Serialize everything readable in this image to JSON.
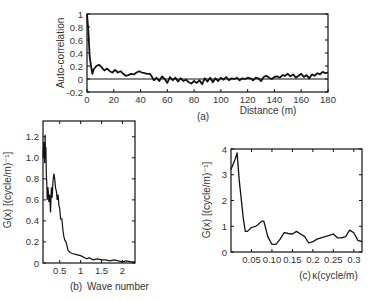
{
  "chart_data": [
    {
      "panel": "(a)",
      "type": "line",
      "title": "",
      "xlabel": "Distance (m)",
      "ylabel": "Auto-correlation",
      "xlim": [
        0,
        180
      ],
      "ylim": [
        -0.2,
        1
      ],
      "xticks": [
        0,
        20,
        40,
        60,
        80,
        100,
        120,
        140,
        160,
        180
      ],
      "yticks": [
        -0.2,
        0,
        0.2,
        0.4,
        0.6,
        0.8,
        1
      ],
      "ytick_labels": [
        "-0.2",
        "0",
        "0.2",
        "0.4",
        "0.6",
        "0.8",
        "1"
      ],
      "reference_line": 0,
      "grid": false,
      "x": [
        0,
        1,
        2,
        3,
        4,
        5,
        7,
        9,
        11,
        13,
        15,
        17,
        19,
        21,
        23,
        25,
        27,
        29,
        31,
        33,
        35,
        37,
        39,
        41,
        43,
        45,
        47,
        48,
        50,
        52,
        54,
        56,
        58,
        60,
        62,
        64,
        66,
        68,
        70,
        72,
        74,
        76,
        78,
        80,
        82,
        84,
        86,
        88,
        90,
        92,
        94,
        96,
        98,
        100,
        102,
        104,
        106,
        108,
        110,
        112,
        114,
        116,
        118,
        120,
        122,
        124,
        126,
        128,
        130,
        132,
        134,
        136,
        138,
        140,
        142,
        144,
        146,
        148,
        150,
        152,
        154,
        156,
        158,
        160,
        162,
        164,
        166,
        168,
        170,
        172,
        174,
        176,
        178,
        180
      ],
      "values": [
        1.0,
        0.75,
        0.35,
        0.2,
        0.08,
        0.15,
        0.2,
        0.22,
        0.18,
        0.13,
        0.16,
        0.12,
        0.1,
        0.14,
        0.1,
        0.12,
        0.08,
        0.05,
        0.06,
        0.08,
        0.07,
        0.1,
        0.12,
        0.1,
        0.09,
        0.08,
        0.08,
        0.05,
        -0.02,
        0.02,
        -0.03,
        0.04,
        0.0,
        -0.06,
        0.03,
        -0.02,
        0.02,
        -0.04,
        0.01,
        -0.03,
        -0.01,
        -0.05,
        -0.07,
        -0.03,
        -0.06,
        -0.02,
        -0.08,
        0.01,
        -0.04,
        0.02,
        -0.05,
        0.01,
        -0.03,
        0.02,
        -0.01,
        0.03,
        -0.02,
        0.01,
        0.0,
        0.02,
        -0.02,
        0.01,
        0.0,
        0.02,
        0.01,
        -0.02,
        0.02,
        0.01,
        -0.03,
        0.03,
        0.05,
        0.02,
        0.0,
        0.03,
        0.04,
        0.02,
        0.06,
        0.05,
        0.08,
        0.04,
        0.07,
        0.02,
        0.05,
        0.08,
        0.03,
        0.06,
        0.01,
        0.07,
        0.05,
        0.09,
        0.07,
        0.11,
        0.09,
        0.1
      ]
    },
    {
      "panel": "(b)",
      "type": "line",
      "title": "",
      "xlabel": "Wave number",
      "ylabel": "G(x) [(cycle/m)⁻¹]",
      "xlim": [
        0.1,
        2.3
      ],
      "ylim": [
        0,
        1.3
      ],
      "xticks": [
        0.5,
        1,
        1.5,
        2
      ],
      "xtick_labels": [
        "0.5",
        "1",
        "1.5",
        "2"
      ],
      "yticks": [
        0,
        0.2,
        0.4,
        0.6,
        0.8,
        1.0,
        1.2
      ],
      "ytick_labels": [
        "0",
        "0.2",
        "0.4",
        "0.6",
        "0.8",
        "1.0",
        "1.2"
      ],
      "grid": false,
      "x": [
        0.1,
        0.12,
        0.14,
        0.15,
        0.16,
        0.17,
        0.18,
        0.19,
        0.2,
        0.22,
        0.24,
        0.26,
        0.28,
        0.3,
        0.32,
        0.34,
        0.36,
        0.38,
        0.4,
        0.42,
        0.44,
        0.46,
        0.48,
        0.5,
        0.52,
        0.55,
        0.58,
        0.6,
        0.62,
        0.65,
        0.68,
        0.7,
        0.75,
        0.8,
        0.9,
        1.0,
        1.1,
        1.15,
        1.2,
        1.3,
        1.4,
        1.5,
        1.6,
        1.7,
        1.8,
        1.9,
        2.0,
        2.1,
        2.2,
        2.3
      ],
      "values": [
        1.0,
        1.15,
        0.95,
        1.22,
        1.05,
        1.1,
        0.85,
        0.75,
        0.6,
        0.72,
        0.58,
        0.65,
        0.48,
        0.72,
        0.62,
        0.78,
        0.85,
        0.8,
        0.72,
        0.68,
        0.6,
        0.65,
        0.55,
        0.52,
        0.42,
        0.42,
        0.3,
        0.25,
        0.22,
        0.2,
        0.15,
        0.12,
        0.1,
        0.09,
        0.08,
        0.07,
        0.05,
        0.04,
        0.05,
        0.03,
        0.04,
        0.03,
        0.03,
        0.02,
        0.03,
        0.02,
        0.01,
        0.02,
        0.01,
        0.01
      ]
    },
    {
      "panel": "(c)",
      "type": "line",
      "title": "",
      "xlabel": "κ(cycle/m)",
      "ylabel": "G(x) [(cycle/m)⁻¹]",
      "xlim": [
        0.0,
        0.32
      ],
      "ylim": [
        0,
        4
      ],
      "xticks": [
        0.05,
        0.1,
        0.15,
        0.2,
        0.25,
        0.3
      ],
      "xtick_labels": [
        "0.05",
        "0.10",
        "0.15",
        "0.2",
        "0.25",
        "0.3"
      ],
      "yticks": [
        0,
        1,
        2,
        3,
        4
      ],
      "ytick_labels": [
        "0",
        "1",
        "2",
        "3",
        "4"
      ],
      "grid": false,
      "x": [
        0.0,
        0.01,
        0.015,
        0.02,
        0.03,
        0.035,
        0.04,
        0.05,
        0.06,
        0.065,
        0.075,
        0.08,
        0.09,
        0.1,
        0.11,
        0.12,
        0.13,
        0.14,
        0.15,
        0.16,
        0.17,
        0.18,
        0.19,
        0.2,
        0.21,
        0.22,
        0.23,
        0.24,
        0.25,
        0.26,
        0.27,
        0.28,
        0.29,
        0.3,
        0.31,
        0.32
      ],
      "values": [
        3.2,
        3.6,
        3.85,
        2.8,
        1.3,
        0.8,
        0.8,
        0.95,
        1.0,
        1.05,
        1.2,
        1.2,
        0.6,
        0.3,
        0.3,
        0.5,
        0.75,
        0.72,
        0.7,
        0.8,
        0.7,
        0.6,
        0.35,
        0.4,
        0.5,
        0.55,
        0.6,
        0.65,
        0.7,
        0.55,
        0.55,
        0.6,
        0.85,
        0.75,
        0.45,
        0.4
      ]
    }
  ],
  "labels": {
    "a": {
      "panel": "(a)",
      "xlabel": "Distance (m)",
      "ylabel": "Auto-correlation"
    },
    "b": {
      "panel": "(b)",
      "xlabel": "Wave number",
      "ylabel": "G(x) [(cycle/m)⁻¹]"
    },
    "c": {
      "panel": "(c)",
      "xlabel": "κ(cycle/m)",
      "ylabel": "G(x) [(cycle/m)⁻¹]"
    }
  }
}
